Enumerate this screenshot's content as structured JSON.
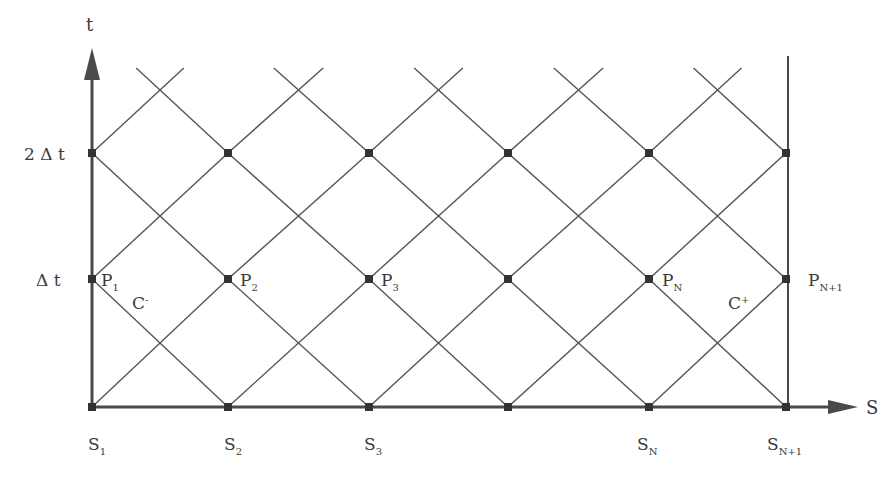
{
  "axes": {
    "t_label": "t",
    "s_label": "S",
    "t_ticks": [
      {
        "label": "2 Δ t",
        "y": 153
      },
      {
        "label": "Δ t",
        "y": 279
      }
    ]
  },
  "grid": {
    "x_nodes": [
      92,
      228,
      369,
      508,
      649,
      786
    ],
    "y_levels": [
      407,
      279,
      153
    ],
    "mid_y_levels": [
      343,
      214,
      88
    ],
    "line_color": "#555555",
    "axis_color": "#4a4a4a",
    "node_color": "#333333"
  },
  "s_labels": [
    {
      "base": "S",
      "sub": "1",
      "x": 88
    },
    {
      "base": "S",
      "sub": "2",
      "x": 224
    },
    {
      "base": "S",
      "sub": "3",
      "x": 364
    },
    {
      "base": "S",
      "sub": "N",
      "x": 637
    },
    {
      "base": "S",
      "sub": "N+1",
      "x": 767
    }
  ],
  "p_labels": [
    {
      "base": "P",
      "sub": "1",
      "x": 101
    },
    {
      "base": "P",
      "sub": "2",
      "x": 240
    },
    {
      "base": "P",
      "sub": "3",
      "x": 381
    },
    {
      "base": "P",
      "sub": "N",
      "x": 662
    },
    {
      "base": "P",
      "sub": "N+1",
      "x": 808
    }
  ],
  "characteristics": {
    "c_minus": {
      "base": "C",
      "sup": "-"
    },
    "c_plus": {
      "base": "C",
      "sup": "+"
    }
  }
}
